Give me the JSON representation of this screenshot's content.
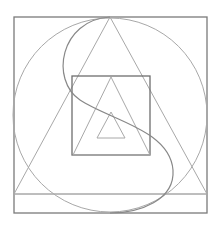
{
  "figure": {
    "cut_title": "— — — — — —   — —",
    "colors": {
      "stroke_dark": "#7a7a7a",
      "stroke_light": "#a8a8a8",
      "background": "#ffffff"
    },
    "shapes": [
      {
        "type": "square",
        "name": "outer-square",
        "x": 14,
        "y": 17,
        "w": 193,
        "h": 196
      },
      {
        "type": "circle",
        "name": "circle",
        "cx": 110,
        "cy": 115,
        "r": 97
      },
      {
        "type": "triangle",
        "name": "large-triangle",
        "points": "110,17 14,194 207,194"
      },
      {
        "type": "line",
        "name": "base-line",
        "x1": 14,
        "y1": 194,
        "x2": 207,
        "y2": 194
      },
      {
        "type": "square",
        "name": "inner-square",
        "x": 72,
        "y": 76,
        "w": 78,
        "h": 79
      },
      {
        "type": "triangle",
        "name": "middle-triangle",
        "points": "111,77 73,155 150,155"
      },
      {
        "type": "triangle",
        "name": "small-triangle",
        "points": "111,112 97,138 125,138"
      },
      {
        "type": "s-curve",
        "name": "s-curve"
      }
    ]
  }
}
